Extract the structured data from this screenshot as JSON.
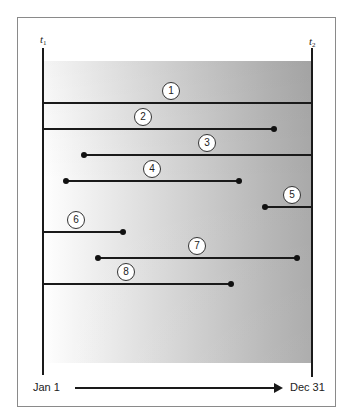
{
  "diagram": {
    "start_label": {
      "base": "t",
      "sub": "1"
    },
    "end_label": {
      "base": "t",
      "sub": "2"
    },
    "axis": {
      "start": "Jan 1",
      "end": "Dec 31"
    },
    "colors": {
      "line": "#1a1a1a",
      "gradient_left": "#ffffff",
      "gradient_right": "#a9a9a9"
    },
    "intervals": [
      {
        "id": "1",
        "y": 103,
        "x_start": 43,
        "x_end": 312,
        "start_dot": false,
        "end_dot": false,
        "label_x": 171
      },
      {
        "id": "2",
        "y": 129,
        "x_start": 43,
        "x_end": 274,
        "start_dot": false,
        "end_dot": true,
        "label_x": 143
      },
      {
        "id": "3",
        "y": 155,
        "x_start": 84,
        "x_end": 312,
        "start_dot": true,
        "end_dot": false,
        "label_x": 207
      },
      {
        "id": "4",
        "y": 181,
        "x_start": 66,
        "x_end": 239,
        "start_dot": true,
        "end_dot": true,
        "label_x": 152
      },
      {
        "id": "5",
        "y": 207,
        "x_start": 265,
        "x_end": 312,
        "start_dot": true,
        "end_dot": false,
        "label_x": 292
      },
      {
        "id": "6",
        "y": 232,
        "x_start": 43,
        "x_end": 123,
        "start_dot": false,
        "end_dot": true,
        "label_x": 76
      },
      {
        "id": "7",
        "y": 258,
        "x_start": 98,
        "x_end": 297,
        "start_dot": true,
        "end_dot": true,
        "label_x": 197
      },
      {
        "id": "8",
        "y": 284,
        "x_start": 43,
        "x_end": 231,
        "start_dot": false,
        "end_dot": true,
        "label_x": 126
      }
    ]
  }
}
